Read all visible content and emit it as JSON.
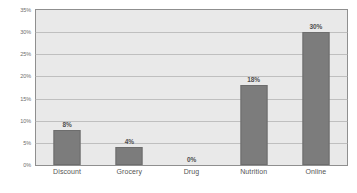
{
  "chart_data": {
    "type": "bar",
    "title": "",
    "title_cropped": true,
    "xlabel": "",
    "ylabel": "",
    "categories": [
      "Discount",
      "Grocery",
      "Drug",
      "Nutrition",
      "Online"
    ],
    "values": [
      8,
      4,
      0,
      18,
      30
    ],
    "data_labels": [
      "8%",
      "4%",
      "0%",
      "18%",
      "30%"
    ],
    "ylim": [
      0,
      35
    ],
    "ytick_values": [
      0,
      5,
      10,
      15,
      20,
      25,
      30,
      35
    ],
    "ytick_labels": [
      "0%",
      "5%",
      "10%",
      "15%",
      "20%",
      "25%",
      "30%",
      "35%"
    ],
    "grid": true,
    "grid_axis": "y",
    "legend": false,
    "legend_position": "none",
    "series": [
      {
        "name": "",
        "values": [
          8,
          4,
          0,
          18,
          30
        ]
      }
    ],
    "colors": {
      "bar_fill": "#7c7c7c",
      "bar_border": "#6d6d6d",
      "plot_background": "#e9e9e9",
      "plot_border": "#8f8f8f",
      "gridline": "#a9a9a9",
      "tick_label": "#6e6e6e",
      "data_label": "#4f4f4f",
      "page_background": "#ffffff"
    }
  }
}
